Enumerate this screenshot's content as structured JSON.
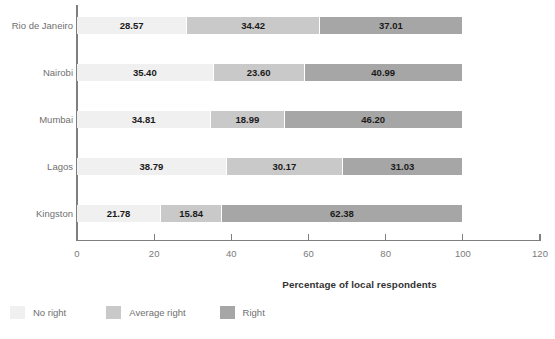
{
  "chart": {
    "type": "bar",
    "xlabel": "Percentage of local respondents",
    "axis_title": "Percentage of local respondents"
  },
  "chart_data": {
    "type": "bar",
    "orientation": "horizontal",
    "stacked": true,
    "title": "",
    "subtitle": "",
    "xlabel": "Percentage of local respondents",
    "ylabel": "",
    "xlim": [
      0,
      120
    ],
    "xticks": [
      0,
      20,
      40,
      60,
      80,
      100,
      120
    ],
    "grid": false,
    "legend_position": "bottom-left",
    "categories": [
      "Rio de Janeiro",
      "Nairobi",
      "Mumbai",
      "Lagos",
      "Kingston"
    ],
    "series": [
      {
        "name": "No right",
        "color": "#f0f0f0",
        "values": [
          28.57,
          35.4,
          34.81,
          38.79,
          21.78
        ]
      },
      {
        "name": "Average right",
        "color": "#c9c9c9",
        "values": [
          34.42,
          23.6,
          18.99,
          30.17,
          15.84
        ]
      },
      {
        "name": "Right",
        "color": "#a6a6a6",
        "values": [
          37.01,
          40.99,
          46.2,
          31.03,
          62.38
        ]
      }
    ],
    "data_labels": [
      [
        "28.57",
        "34.42",
        "37.01"
      ],
      [
        "35.40",
        "23.60",
        "40.99"
      ],
      [
        "34.81",
        "18.99",
        "46.20"
      ],
      [
        "38.79",
        "30.17",
        "31.03"
      ],
      [
        "21.78",
        "15.84",
        "62.38"
      ]
    ]
  },
  "axis": {
    "tick_labels": [
      "0",
      "20",
      "40",
      "60",
      "80",
      "100",
      "120"
    ]
  },
  "legend": {
    "items": [
      {
        "label": "No right",
        "color": "#f0f0f0"
      },
      {
        "label": "Average right",
        "color": "#c9c9c9"
      },
      {
        "label": "Right",
        "color": "#a6a6a6"
      }
    ]
  },
  "colors": {
    "no_right": "#f0f0f0",
    "average_right": "#c9c9c9",
    "right": "#a6a6a6",
    "axis": "#7f7f7f",
    "label_text": "#6f6f6f",
    "value_text": "#1a1a1a",
    "background": "#ffffff"
  }
}
